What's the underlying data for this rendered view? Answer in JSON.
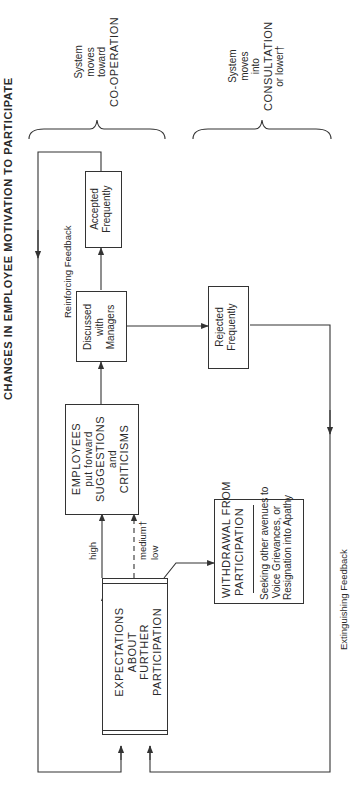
{
  "title": "CHANGES IN EMPLOYEE MOTIVATION TO PARTICIPATE",
  "feedback": {
    "reinforcing": "Reinforcing Feedback",
    "extinguishing": "Extinguishing Feedback"
  },
  "outcomes": {
    "cooperation": [
      "System",
      "moves",
      "toward",
      "CO-OPERATION"
    ],
    "consultation": [
      "System",
      "moves",
      "into",
      "CONSULTATION",
      "or lower†"
    ]
  },
  "boxes": {
    "expectations": [
      "EXPECTATIONS",
      "ABOUT",
      "FURTHER",
      "PARTICIPATION"
    ],
    "employees": [
      "EMPLOYEES",
      "put forward",
      "SUGGESTIONS",
      "and",
      "CRITICISMS"
    ],
    "discussed": [
      "Discussed",
      "with",
      "Managers"
    ],
    "accepted": [
      "Accepted",
      "Frequently"
    ],
    "rejected": [
      "Rejected",
      "Frequently"
    ],
    "withdrawal_title": [
      "WITHDRAWAL FROM",
      "PARTICIPATION"
    ],
    "withdrawal_desc": [
      "Seeking other avenues to",
      "Voice Grievances, or",
      "Resignation into Apathy"
    ]
  },
  "levels": {
    "high": "high",
    "medium": "medium†",
    "low": "low"
  },
  "colors": {
    "line": "#333333",
    "text": "#2a2a2a",
    "background": "#ffffff"
  }
}
